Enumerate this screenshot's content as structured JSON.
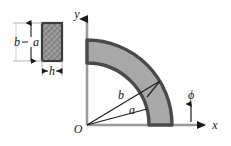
{
  "figure": {
    "type": "engineering-diagram",
    "colors": {
      "background": "#fefefe",
      "annulus_fill": "#a8a8a8",
      "annulus_stroke": "#4a4a4a",
      "axis": "#8a8a8a",
      "line": "#1a1a1a",
      "hatch_fill": "#9a9a9a",
      "hatch_stroke": "#3c3c3c"
    },
    "axes": {
      "x_label": "x",
      "y_label": "y",
      "origin_label": "O"
    },
    "annulus": {
      "inner_radius_label": "a",
      "outer_radius_label": "b",
      "angle_label": "ϕ",
      "start_angle_deg": 0,
      "end_angle_deg": 90,
      "inner_radius_px": 62,
      "outer_radius_px": 85,
      "radial_line_b_angle_deg": 31,
      "radial_line_a_angle_deg": 15
    },
    "cross_section": {
      "height_label": "a",
      "outer_height_label": "b",
      "width_label": "h"
    }
  }
}
